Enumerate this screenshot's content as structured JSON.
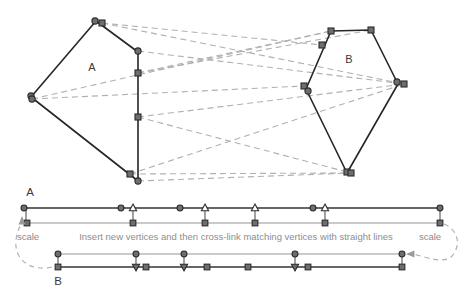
{
  "figure": {
    "caption": "Insert new vertices and then cross-link matching vertices with straight lines",
    "labels": {
      "polygon_a": "A",
      "polygon_b": "B",
      "row_a": "A",
      "row_b": "B",
      "scale_left": "scale",
      "scale_right": "scale"
    },
    "colors": {
      "solid_stroke": "#262626",
      "dashed_stroke": "#b0b0b0",
      "marker_fill": "#6e6e6e",
      "marker_stroke": "#2b2b2b",
      "open_marker_fill": "#ffffff",
      "text": "#3a3a3a",
      "muted_text": "#8e8e8e",
      "background": "#ffffff"
    }
  },
  "diagram_data": {
    "type": "polygon-correspondence-diagram",
    "polygon_a": {
      "name": "A",
      "label_pos": [
        92,
        71
      ],
      "outline": [
        [
          31,
          97
        ],
        [
          96,
          21
        ],
        [
          138,
          52
        ],
        [
          138,
          181
        ],
        [
          31,
          97
        ]
      ],
      "vertices": [
        {
          "x": 31,
          "y": 96,
          "shape": "circle"
        },
        {
          "x": 32,
          "y": 99,
          "shape": "circle"
        },
        {
          "x": 95,
          "y": 21,
          "shape": "circle"
        },
        {
          "x": 102,
          "y": 23,
          "shape": "square"
        },
        {
          "x": 138,
          "y": 51,
          "shape": "circle"
        },
        {
          "x": 138,
          "y": 73,
          "shape": "square"
        },
        {
          "x": 138,
          "y": 117,
          "shape": "square"
        },
        {
          "x": 130,
          "y": 174,
          "shape": "square"
        },
        {
          "x": 138,
          "y": 181,
          "shape": "circle"
        }
      ]
    },
    "polygon_b": {
      "name": "B",
      "label_pos": [
        349,
        63
      ],
      "outline": [
        [
          331,
          31
        ],
        [
          371,
          30
        ],
        [
          398,
          84
        ],
        [
          347,
          173
        ],
        [
          306,
          89
        ],
        [
          331,
          31
        ]
      ],
      "vertices": [
        {
          "x": 331,
          "y": 31,
          "shape": "square"
        },
        {
          "x": 371,
          "y": 30,
          "shape": "square"
        },
        {
          "x": 322,
          "y": 45,
          "shape": "square"
        },
        {
          "x": 397,
          "y": 82,
          "shape": "circle"
        },
        {
          "x": 404,
          "y": 84,
          "shape": "square"
        },
        {
          "x": 304,
          "y": 86,
          "shape": "square"
        },
        {
          "x": 308,
          "y": 91,
          "shape": "circle"
        },
        {
          "x": 347,
          "y": 172,
          "shape": "square"
        },
        {
          "x": 351,
          "y": 173,
          "shape": "square"
        }
      ]
    },
    "cross_links": [
      {
        "from": [
          102,
          23
        ],
        "to": [
          404,
          84
        ]
      },
      {
        "from": [
          102,
          23
        ],
        "to": [
          322,
          45
        ]
      },
      {
        "from": [
          138,
          51
        ],
        "to": [
          404,
          84
        ]
      },
      {
        "from": [
          138,
          73
        ],
        "to": [
          371,
          30
        ]
      },
      {
        "from": [
          138,
          73
        ],
        "to": [
          331,
          31
        ]
      },
      {
        "from": [
          32,
          99
        ],
        "to": [
          331,
          31
        ]
      },
      {
        "from": [
          32,
          99
        ],
        "to": [
          304,
          86
        ]
      },
      {
        "from": [
          138,
          117
        ],
        "to": [
          404,
          84
        ]
      },
      {
        "from": [
          138,
          117
        ],
        "to": [
          351,
          173
        ]
      },
      {
        "from": [
          130,
          174
        ],
        "to": [
          404,
          84
        ]
      },
      {
        "from": [
          130,
          174
        ],
        "to": [
          351,
          173
        ]
      },
      {
        "from": [
          138,
          181
        ],
        "to": [
          351,
          173
        ]
      }
    ],
    "row_a": {
      "label": "A",
      "label_pos": [
        30,
        196
      ],
      "upper_line": {
        "y": 208,
        "x_start": 24,
        "x_end": 443,
        "stroke": "dark"
      },
      "lower_line": {
        "y": 223,
        "x_start": 24,
        "x_end": 443,
        "stroke": "light"
      },
      "upper_markers": [
        {
          "x": 24,
          "shape": "circle"
        },
        {
          "x": 121,
          "shape": "circle"
        },
        {
          "x": 133,
          "shape": "triangle-up"
        },
        {
          "x": 180,
          "shape": "circle"
        },
        {
          "x": 205,
          "shape": "triangle-up"
        },
        {
          "x": 255,
          "shape": "triangle-up"
        },
        {
          "x": 313,
          "shape": "circle"
        },
        {
          "x": 325,
          "shape": "triangle-up"
        },
        {
          "x": 440,
          "shape": "circle"
        }
      ],
      "lower_markers": [
        {
          "x": 27,
          "shape": "square"
        },
        {
          "x": 133,
          "shape": "square"
        },
        {
          "x": 205,
          "shape": "square"
        },
        {
          "x": 255,
          "shape": "square"
        },
        {
          "x": 325,
          "shape": "square"
        },
        {
          "x": 440,
          "shape": "square"
        }
      ],
      "connectors": [
        {
          "x": 133,
          "y1": 208,
          "y2": 223
        },
        {
          "x": 205,
          "y1": 208,
          "y2": 223
        },
        {
          "x": 255,
          "y1": 208,
          "y2": 223
        },
        {
          "x": 325,
          "y1": 208,
          "y2": 223
        },
        {
          "x": 440,
          "y1": 208,
          "y2": 223
        },
        {
          "x": 26,
          "y1": 208,
          "y2": 223
        }
      ]
    },
    "row_b": {
      "label": "B",
      "label_pos": [
        58,
        285
      ],
      "upper_line": {
        "y": 254,
        "x_start": 58,
        "x_end": 403,
        "stroke": "light"
      },
      "lower_line": {
        "y": 267,
        "x_start": 57,
        "x_end": 403,
        "stroke": "dark"
      },
      "upper_markers": [
        {
          "x": 58,
          "shape": "circle"
        },
        {
          "x": 136,
          "shape": "circle"
        },
        {
          "x": 184,
          "shape": "circle"
        },
        {
          "x": 295,
          "shape": "circle"
        },
        {
          "x": 402,
          "shape": "circle"
        }
      ],
      "lower_markers": [
        {
          "x": 58,
          "shape": "square"
        },
        {
          "x": 136,
          "shape": "triangle-down"
        },
        {
          "x": 146,
          "shape": "square"
        },
        {
          "x": 184,
          "shape": "triangle-down"
        },
        {
          "x": 207,
          "shape": "square"
        },
        {
          "x": 248,
          "shape": "square"
        },
        {
          "x": 295,
          "shape": "triangle-down"
        },
        {
          "x": 308,
          "shape": "square"
        },
        {
          "x": 402,
          "shape": "square"
        }
      ],
      "connectors": [
        {
          "x": 58,
          "y1": 254,
          "y2": 267
        },
        {
          "x": 136,
          "y1": 254,
          "y2": 267
        },
        {
          "x": 184,
          "y1": 254,
          "y2": 267
        },
        {
          "x": 295,
          "y1": 254,
          "y2": 267
        },
        {
          "x": 402,
          "y1": 254,
          "y2": 267
        }
      ]
    },
    "scale_arrows": [
      {
        "id": "scale-left",
        "label": "scale",
        "label_pos": [
          28,
          240
        ],
        "path": "M 52,267 C 28,272 14,258 16,240 C 17,232 19,228 22,223",
        "arrow_at": [
          22,
          221
        ],
        "arrow_dir": "up"
      },
      {
        "id": "scale-right",
        "label": "scale",
        "label_pos": [
          430,
          240
        ],
        "path": "M 444,224 C 459,230 461,246 452,256 C 444,264 429,258 413,254",
        "arrow_at": [
          411,
          254
        ],
        "arrow_dir": "left"
      }
    ],
    "caption": {
      "text": "Insert new vertices and then cross-link matching vertices with straight lines",
      "pos": [
        236,
        240
      ]
    }
  }
}
